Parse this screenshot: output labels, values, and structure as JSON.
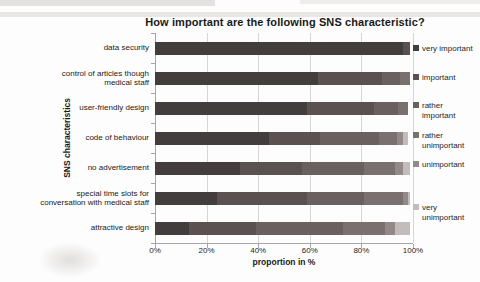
{
  "chart_data": {
    "type": "bar",
    "variant": "horizontal-stacked",
    "title": "How important are the following SNS characteristic?",
    "xlabel": "proportion in %",
    "ylabel": "SNS characteristics",
    "x_ticks": [
      "0%",
      "20%",
      "40%",
      "60%",
      "80%",
      "100%"
    ],
    "xlim": [
      0,
      100
    ],
    "grid": "vertical",
    "legend_position": "right",
    "categories": [
      "data security",
      "control of articles though medical staff",
      "user-friendly design",
      "code of behaviour",
      "no advertisement",
      "special time slots for conversation with medical staff",
      "attractive design"
    ],
    "series": [
      {
        "name": "very important",
        "color": "#443d3d",
        "values": [
          96,
          63,
          59,
          44,
          33,
          24,
          13
        ]
      },
      {
        "name": "important",
        "color": "#5b5151",
        "values": [
          3,
          25,
          26,
          20,
          24,
          35,
          26
        ]
      },
      {
        "name": "rather important",
        "color": "#6a6060",
        "values": [
          0,
          7,
          9,
          23,
          24,
          22,
          34
        ]
      },
      {
        "name": "rather unimportant",
        "color": "#7a7070",
        "values": [
          0,
          4,
          4,
          7,
          12,
          15,
          16
        ]
      },
      {
        "name": "unimportant",
        "color": "#938989",
        "values": [
          0,
          0,
          0,
          2,
          3,
          2,
          4
        ]
      },
      {
        "name": "very unimportant",
        "color": "#c3bcbc",
        "values": [
          0,
          0,
          0,
          2,
          3,
          1,
          6
        ]
      }
    ]
  },
  "colors": {
    "gridline": "#d8d5d5",
    "axis": "#a8a5a5",
    "text": "#1a1a1a"
  }
}
